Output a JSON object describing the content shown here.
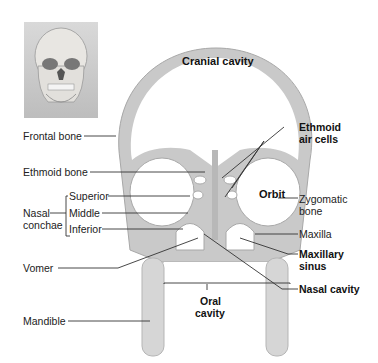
{
  "figure": {
    "thumbnail": {
      "subject": "skull-front-view"
    },
    "regions": {
      "cranial_cavity": "Cranial cavity",
      "orbit": "Orbit",
      "oral_cavity_line1": "Oral",
      "oral_cavity_line2": "cavity"
    },
    "left_labels": {
      "frontal_bone": "Frontal bone",
      "ethmoid_bone": "Ethmoid bone",
      "nasal_conchae_line1": "Nasal",
      "nasal_conchae_line2": "conchae",
      "superior": "Superior",
      "middle": "Middle",
      "inferior": "Inferior",
      "vomer": "Vomer",
      "mandible": "Mandible"
    },
    "right_labels": {
      "ethmoid_air_cells_line1": "Ethmoid",
      "ethmoid_air_cells_line2": "air cells",
      "zygomatic_line1": "Zygomatic",
      "zygomatic_line2": "bone",
      "maxilla": "Maxilla",
      "maxillary_sinus_line1": "Maxillary",
      "maxillary_sinus_line2": "sinus",
      "nasal_cavity": "Nasal cavity"
    },
    "colors": {
      "bone": "#c9c9c9",
      "bone_dark": "#a8a8a8",
      "leader": "#333333"
    }
  }
}
